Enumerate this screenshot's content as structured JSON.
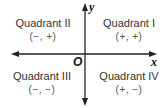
{
  "diagram": {
    "axes": {
      "x_label": "x",
      "y_label": "y",
      "origin_label": "O",
      "color": "#222222"
    },
    "quadrants": [
      {
        "name": "Quadrant II",
        "signs": "(−, +)"
      },
      {
        "name": "Quadrant I",
        "signs": "(+, +)"
      },
      {
        "name": "Quadrant III",
        "signs": "(−, −)"
      },
      {
        "name": "Quadrant IV",
        "signs": "(+, −)"
      }
    ]
  }
}
